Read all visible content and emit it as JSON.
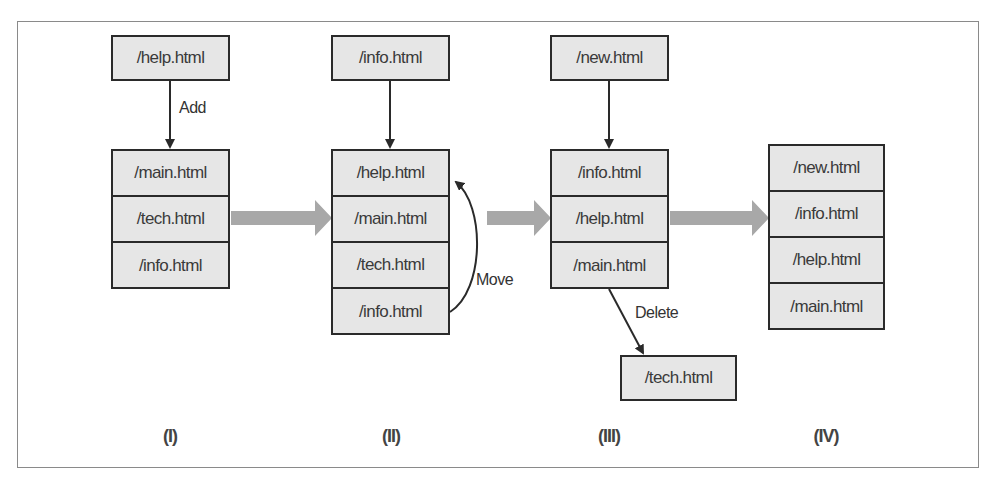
{
  "diagram": {
    "stages": [
      {
        "label": "(I)",
        "incoming": "/help.html",
        "operation": "Add",
        "list": [
          "/main.html",
          "/tech.html",
          "/info.html"
        ]
      },
      {
        "label": "(II)",
        "incoming": "/info.html",
        "operation": "Move",
        "list": [
          "/help.html",
          "/main.html",
          "/tech.html",
          "/info.html"
        ]
      },
      {
        "label": "(III)",
        "incoming": "/new.html",
        "operation": "Delete",
        "list": [
          "/info.html",
          "/help.html",
          "/main.html"
        ],
        "removed": "/tech.html"
      },
      {
        "label": "(IV)",
        "list": [
          "/new.html",
          "/info.html",
          "/help.html",
          "/main.html"
        ]
      }
    ],
    "colors": {
      "box_fill": "#e6e6e6",
      "box_border": "#2a2a2a",
      "transition_arrow": "#a8a8a8",
      "frame_border": "#8a8a8a"
    }
  }
}
